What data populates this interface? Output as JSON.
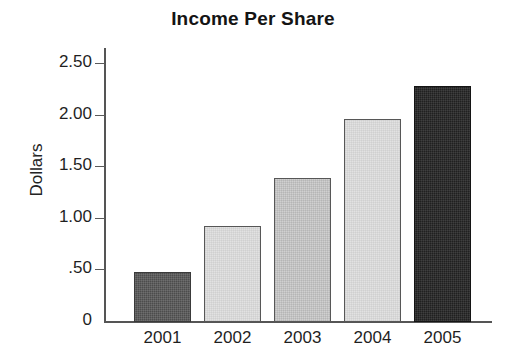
{
  "chart_data": {
    "type": "bar",
    "title": "Income Per Share",
    "xlabel": "",
    "ylabel": "Dollars",
    "categories": [
      "2001",
      "2002",
      "2003",
      "2004",
      "2005"
    ],
    "values": [
      0.49,
      0.93,
      1.4,
      1.97,
      2.29
    ],
    "ylim": [
      0,
      2.65
    ],
    "y_ticks": [
      0,
      0.5,
      1.0,
      1.5,
      2.0,
      2.5
    ],
    "y_tick_labels": [
      "0",
      ".50",
      "1.00",
      "1.50",
      "2.00",
      "2.50"
    ],
    "grid": false,
    "legend": false,
    "legend_position": "none",
    "bar_styles": [
      "dark-gray",
      "light-gray",
      "medium-gray",
      "light-gray",
      "near-black"
    ],
    "series": [
      {
        "name": "Income Per Share",
        "values": [
          0.49,
          0.93,
          1.4,
          1.97,
          2.29
        ]
      }
    ],
    "points": [
      {
        "category": "2001",
        "value": 0.49,
        "style": "dark-gray"
      },
      {
        "category": "2002",
        "value": 0.93,
        "style": "light-gray"
      },
      {
        "category": "2003",
        "value": 1.4,
        "style": "medium-gray"
      },
      {
        "category": "2004",
        "value": 1.97,
        "style": "light-gray"
      },
      {
        "category": "2005",
        "value": 2.29,
        "style": "near-black"
      }
    ]
  },
  "colors": {
    "background": "#ffffff",
    "axis": "#555555",
    "text": "#1a1a1a",
    "bar_dark": "#4c4c4c",
    "bar_light": "#e2e2e2",
    "bar_medium": "#d0d0d0",
    "bar_black": "#202020"
  }
}
